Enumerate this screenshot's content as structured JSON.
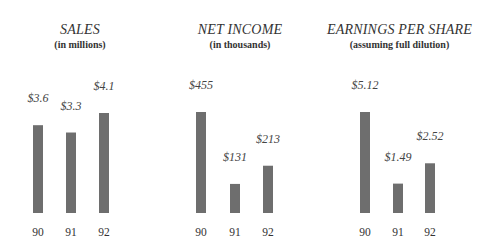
{
  "chart_data": [
    {
      "type": "bar",
      "title": "SALES",
      "subtitle": "(in millions)",
      "categories": [
        "90",
        "91",
        "92"
      ],
      "values": [
        3.6,
        3.3,
        4.1
      ],
      "value_labels": [
        "$3.6",
        "$3.3",
        "$4.1"
      ],
      "xlabel": "",
      "ylabel": "",
      "ylim": [
        0,
        4.1
      ],
      "grid": false,
      "bar_color": "#6e6e6e"
    },
    {
      "type": "bar",
      "title": "NET INCOME",
      "subtitle": "(in thousands)",
      "categories": [
        "90",
        "91",
        "92"
      ],
      "values": [
        455,
        131,
        213
      ],
      "value_labels": [
        "$455",
        "$131",
        "$213"
      ],
      "xlabel": "",
      "ylabel": "",
      "ylim": [
        0,
        455
      ],
      "grid": false,
      "bar_color": "#6e6e6e"
    },
    {
      "type": "bar",
      "title": "EARNINGS PER SHARE",
      "subtitle": "(assuming full dilution)",
      "categories": [
        "90",
        "91",
        "92"
      ],
      "values": [
        5.12,
        1.49,
        2.52
      ],
      "value_labels": [
        "$5.12",
        "$1.49",
        "$2.52"
      ],
      "xlabel": "",
      "ylabel": "",
      "ylim": [
        0,
        5.12
      ],
      "grid": false,
      "bar_color": "#6e6e6e"
    }
  ]
}
